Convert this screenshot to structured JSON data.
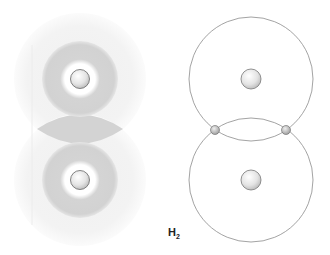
{
  "diagram": {
    "title": "H",
    "subscript": "2",
    "left_panel": {
      "description": "electron cloud (probability density) model of H2",
      "nuclei": [
        {
          "cx": 80,
          "cy": 79
        },
        {
          "cx": 80,
          "cy": 180
        }
      ],
      "colors": {
        "cloud": "#d2d2d2",
        "halo": "#f1f1f1",
        "nucleus_fill": "#e6e6e6",
        "nucleus_stroke": "#6a6a6a"
      }
    },
    "right_panel": {
      "description": "Bohr model of H2 with shared electron pair",
      "nuclei": [
        {
          "cx": 251,
          "cy": 79
        },
        {
          "cx": 251,
          "cy": 180
        }
      ],
      "orbit_radius": 62,
      "electrons": [
        {
          "cx": 215,
          "cy": 130
        },
        {
          "cx": 286,
          "cy": 130
        }
      ],
      "colors": {
        "orbit": "#8a8a8a",
        "electron_fill": "#bdbdbd",
        "nucleus_fill": "#e6e6e6"
      }
    }
  }
}
